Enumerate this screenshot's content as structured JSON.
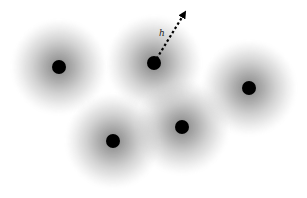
{
  "diagram": {
    "colors": {
      "background": "#ffffff",
      "particle": "#000000",
      "kernel": "#6e6e6e",
      "arrow": "#000000"
    },
    "particles": [
      {
        "id": "p1"
      },
      {
        "id": "p2",
        "has_arrow": true
      },
      {
        "id": "p3"
      },
      {
        "id": "p4"
      },
      {
        "id": "p5"
      }
    ],
    "arrow_label": "h"
  }
}
